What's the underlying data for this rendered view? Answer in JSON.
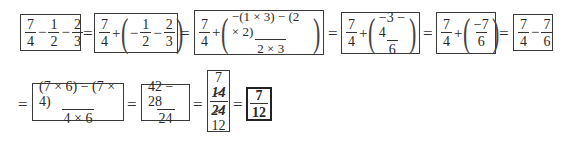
{
  "row1": {
    "box1": {
      "a_num": "7",
      "a_den": "4",
      "op1": "−",
      "b_num": "1",
      "b_den": "2",
      "op2": "−",
      "c_num": "2",
      "c_den": "3"
    },
    "eq1": "=",
    "box2": {
      "a_num": "7",
      "a_den": "4",
      "op1": "+",
      "lparen": "(",
      "neg": "−",
      "b_num": "1",
      "b_den": "2",
      "op2": "−",
      "c_num": "2",
      "c_den": "3",
      "rparen": ")"
    },
    "eq2": "=",
    "box3": {
      "a_num": "7",
      "a_den": "4",
      "op1": "+",
      "lparen": "(",
      "b_num": "−(1 × 3) − (2 × 2)",
      "b_den": "2 × 3",
      "rparen": ")"
    },
    "eq3": "=",
    "box4": {
      "a_num": "7",
      "a_den": "4",
      "op1": "+",
      "lparen": "(",
      "b_num": "−3 − 4",
      "b_den": "6",
      "rparen": ")"
    },
    "eq4": "=",
    "box5": {
      "a_num": "7",
      "a_den": "4",
      "op1": "+",
      "lparen": "(",
      "b_num": "−7",
      "b_den": "6",
      "rparen": ")"
    },
    "eq5": "=",
    "box6": {
      "a_num": "7",
      "a_den": "4",
      "op1": "−",
      "b_num": "7",
      "b_den": "6"
    }
  },
  "row2": {
    "eq0": "=",
    "box7": {
      "num": "(7 × 6) − (7 × 4)",
      "den": "4 × 6"
    },
    "eq1": "=",
    "box8": {
      "num": "42 − 28",
      "den": "24"
    },
    "eq2": "=",
    "box9": {
      "top": "7",
      "num_struck": "14",
      "den_struck": "24",
      "bottom": "12"
    },
    "eq3": "=",
    "box10": {
      "num": "7",
      "den": "12"
    }
  }
}
